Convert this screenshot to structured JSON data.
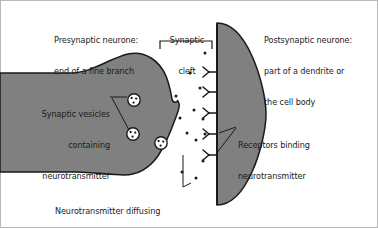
{
  "figure": {
    "type": "biology-diagram",
    "colors": {
      "neurone_fill": "#808080",
      "outline": "#1a1a1a",
      "background": "#ffffff",
      "text": "#1a1a1a",
      "vesicle_fill": "#ffffff"
    }
  },
  "labels": {
    "presynaptic": {
      "line1": "Presynaptic neurone:",
      "line2": "end of a fine branch"
    },
    "cleft": {
      "line1": "Synaptic",
      "line2": "cleft"
    },
    "postsynaptic": {
      "line1": "Postsynaptic neurone:",
      "line2": "part of a dendrite or",
      "line3": "the cell body"
    },
    "vesicles": {
      "line1": "Synaptic vesicles",
      "line2": "containing",
      "line3": "neurotransmitter"
    },
    "receptors": {
      "line1": "Receptors binding",
      "line2": "neurotransmitter"
    },
    "diffusing": {
      "line1": "Neurotransmitter diffusing"
    }
  },
  "parts": {
    "presynaptic_terminal": "presynaptic-neurone-shape",
    "postsynaptic_membrane": "postsynaptic-neurone-shape",
    "synaptic_cleft_bracket": "synaptic-cleft-bracket",
    "vesicle_count": 3,
    "receptor_count": 5,
    "neurotransmitter_dot_count": 13
  },
  "vesicles": [
    {
      "cx": 134,
      "cy": 100,
      "r": 6.2
    },
    {
      "cx": 133,
      "cy": 134,
      "r": 6.2
    },
    {
      "cx": 161,
      "cy": 143,
      "r": 6.2
    }
  ],
  "receptors": [
    {
      "x": 214,
      "y": 72
    },
    {
      "x": 214,
      "y": 92
    },
    {
      "x": 214,
      "y": 113
    },
    {
      "x": 214,
      "y": 134
    },
    {
      "x": 214,
      "y": 155
    }
  ],
  "neurotransmitter_dots": [
    {
      "cx": 205,
      "cy": 53
    },
    {
      "cx": 190,
      "cy": 73
    },
    {
      "cx": 200,
      "cy": 88
    },
    {
      "cx": 176,
      "cy": 96
    },
    {
      "cx": 194,
      "cy": 110
    },
    {
      "cx": 180,
      "cy": 118
    },
    {
      "cx": 203,
      "cy": 119
    },
    {
      "cx": 187,
      "cy": 133
    },
    {
      "cx": 196,
      "cy": 140
    },
    {
      "cx": 208,
      "cy": 135
    },
    {
      "cx": 203,
      "cy": 161
    },
    {
      "cx": 182,
      "cy": 172
    },
    {
      "cx": 196,
      "cy": 178
    }
  ]
}
